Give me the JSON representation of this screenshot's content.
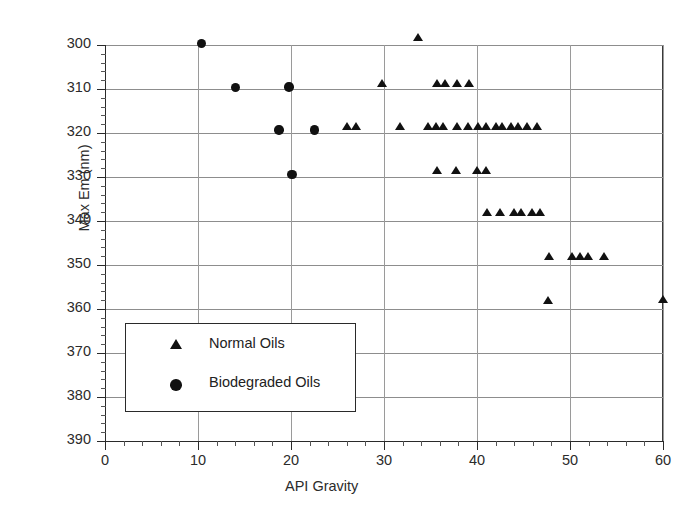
{
  "chart_data": {
    "type": "scatter",
    "title": "",
    "xlabel": "API Gravity",
    "ylabel": "Max Em (nm)",
    "xlim": [
      0,
      60
    ],
    "ylim": [
      300,
      390
    ],
    "xticks": [
      0,
      10,
      20,
      30,
      40,
      50,
      60
    ],
    "yticks": [
      300,
      310,
      320,
      330,
      340,
      350,
      360,
      370,
      380,
      390
    ],
    "grid": true,
    "legend_position": "lower-left inside axes",
    "marker_color": "#111111",
    "series": [
      {
        "name": "Normal Oils",
        "marker": "triangle",
        "points": [
          [
            33.7,
            391.2
          ],
          [
            29.8,
            380.6
          ],
          [
            35.7,
            380.6
          ],
          [
            36.6,
            380.6
          ],
          [
            37.9,
            380.6
          ],
          [
            39.1,
            380.6
          ],
          [
            26.0,
            370.8
          ],
          [
            27.0,
            370.8
          ],
          [
            31.7,
            370.8
          ],
          [
            34.7,
            370.8
          ],
          [
            35.6,
            370.8
          ],
          [
            36.4,
            370.8
          ],
          [
            37.9,
            370.8
          ],
          [
            39.0,
            370.8
          ],
          [
            40.1,
            370.8
          ],
          [
            41.0,
            370.8
          ],
          [
            42.1,
            370.8
          ],
          [
            42.7,
            370.8
          ],
          [
            43.7,
            370.8
          ],
          [
            44.4,
            370.8
          ],
          [
            45.4,
            370.8
          ],
          [
            46.5,
            370.8
          ],
          [
            35.7,
            360.9
          ],
          [
            37.7,
            360.9
          ],
          [
            40.0,
            360.9
          ],
          [
            41.0,
            360.9
          ],
          [
            41.1,
            351.3
          ],
          [
            42.5,
            351.3
          ],
          [
            44.0,
            351.3
          ],
          [
            44.7,
            351.3
          ],
          [
            45.9,
            351.3
          ],
          [
            46.8,
            351.3
          ],
          [
            47.7,
            341.4
          ],
          [
            50.2,
            341.4
          ],
          [
            51.1,
            341.4
          ],
          [
            51.9,
            341.4
          ],
          [
            53.7,
            341.4
          ],
          [
            47.6,
            331.4
          ],
          [
            60.0,
            331.7
          ]
        ]
      },
      {
        "name": "Biodegraded Oils",
        "marker": "circle",
        "points": [
          [
            10.4,
            390.4
          ],
          [
            14.0,
            380.4
          ],
          [
            19.8,
            380.5
          ],
          [
            18.7,
            370.7
          ],
          [
            22.5,
            370.7
          ],
          [
            20.1,
            360.6
          ]
        ]
      }
    ]
  },
  "axis": {
    "y_tick_labels": [
      "390",
      "380",
      "370",
      "360",
      "350",
      "340",
      "330",
      "320",
      "310",
      "300"
    ],
    "x_tick_labels": [
      "0",
      "10",
      "20",
      "30",
      "40",
      "50",
      "60"
    ],
    "y_title": "Max Em (nm)",
    "x_title": "API Gravity"
  },
  "legend": {
    "entries": [
      {
        "label": "Normal Oils",
        "marker": "triangle-marker-icon"
      },
      {
        "label": "Biodegraded Oils",
        "marker": "circle-marker-icon"
      }
    ]
  }
}
